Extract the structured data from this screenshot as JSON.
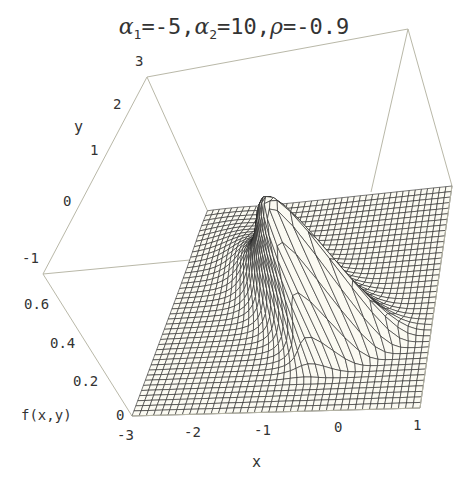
{
  "title": {
    "alpha1_label": "α",
    "alpha1_sub": "1",
    "alpha1_value": "=-5,",
    "alpha2_label": "α",
    "alpha2_sub": "2",
    "alpha2_value": "=10,",
    "rho_label": "ρ",
    "rho_value": "=-0.9"
  },
  "axes": {
    "x_label": "x",
    "y_label": "y",
    "z_label": "f(x,y)",
    "x_ticks": [
      "-3",
      "-2",
      "-1",
      "0",
      "1"
    ],
    "y_ticks": [
      "-1",
      "0",
      "1",
      "2",
      "3"
    ],
    "z_ticks": [
      "0",
      "0.2",
      "0.4",
      "0.6"
    ]
  },
  "colors": {
    "surface_fill": "#fbfaf2",
    "mesh_line": "#222222",
    "box_line": "#b9b8a8",
    "text": "#333333"
  },
  "chart_data": {
    "type": "surface3d",
    "function": "bivariate skew-normal density f(x,y) = 2·φ2(x,y;ρ)·Φ(α1·x + α2·y)",
    "params": {
      "alpha1": -5,
      "alpha2": 10,
      "rho": -0.9
    },
    "xlabel": "x",
    "ylabel": "y",
    "zlabel": "f(x,y)",
    "xlim": [
      -3,
      1
    ],
    "ylim": [
      -1,
      3
    ],
    "zlim": [
      0,
      0.7
    ],
    "x_ticks": [
      -3,
      -2,
      -1,
      0,
      1
    ],
    "y_ticks": [
      -1,
      0,
      1,
      2,
      3
    ],
    "z_ticks": [
      0,
      0.2,
      0.4,
      0.6
    ],
    "mesh": "40x40 grid, hidden-line rendering",
    "peak_approx": {
      "x": -1.0,
      "y": 1.1,
      "z": 0.62
    },
    "box": true,
    "grid": false
  }
}
